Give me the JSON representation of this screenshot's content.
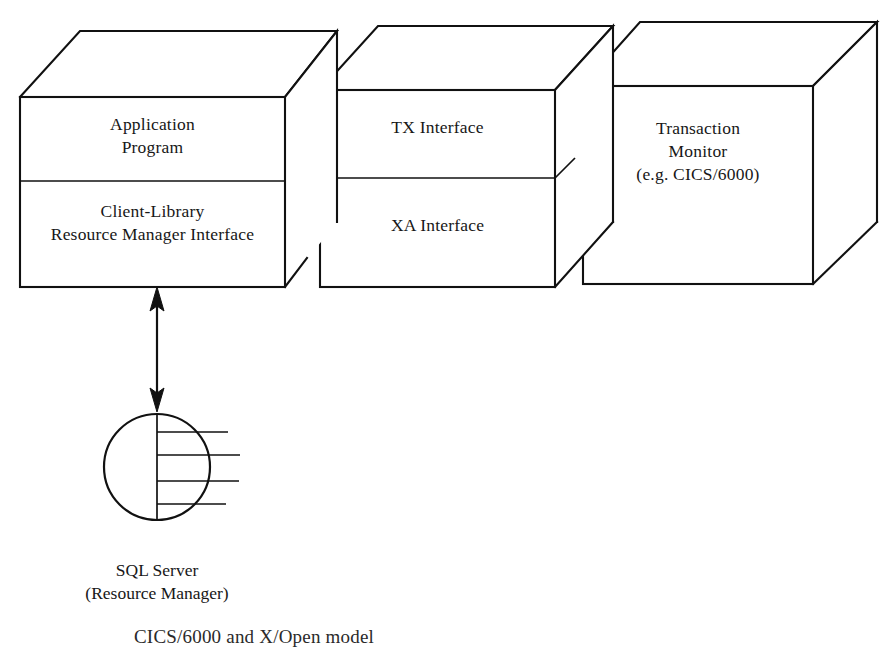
{
  "figure": {
    "type": "3d-block-diagram",
    "background_color": "#ffffff",
    "line_color": "#111111",
    "text_color": "#171717",
    "caption": "CICS/6000 and X/Open model"
  },
  "blocks": [
    {
      "id": "client-block",
      "name": "client-application-block",
      "shape": "3d-box",
      "sections": [
        {
          "id": "application-program",
          "lines": [
            "Application",
            "Program"
          ]
        },
        {
          "id": "client-library",
          "lines": [
            "Client-Library",
            "Resource Manager Interface"
          ]
        }
      ]
    },
    {
      "id": "interface-block",
      "name": "xopen-interface-block",
      "shape": "3d-box",
      "sections": [
        {
          "id": "tx-interface",
          "lines": [
            "TX Interface"
          ]
        },
        {
          "id": "xa-interface",
          "lines": [
            "XA Interface"
          ]
        }
      ]
    },
    {
      "id": "monitor-block",
      "name": "transaction-monitor-block",
      "shape": "3d-box",
      "sections": [
        {
          "id": "transaction-monitor",
          "lines": [
            "Transaction",
            "Monitor",
            "(e.g. CICS/6000)"
          ]
        }
      ]
    }
  ],
  "database": {
    "id": "sql-server-disc",
    "shape": "disc-with-platters",
    "platter_count": 4,
    "label_lines": [
      "SQL Server",
      "(Resource Manager)"
    ]
  },
  "connector": {
    "id": "client-to-sqlserver",
    "style": "double-headed-vertical-arrow",
    "from": "client-library",
    "to": "sql-server-disc"
  }
}
